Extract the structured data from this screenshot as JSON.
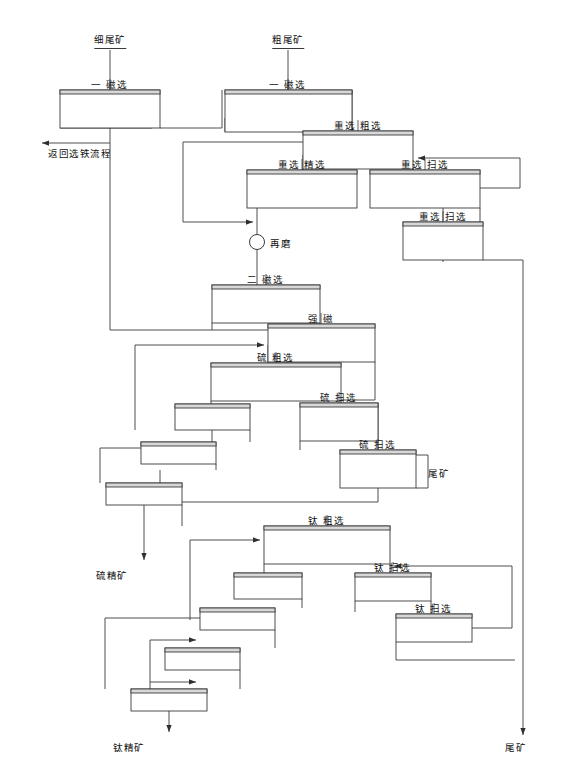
{
  "diagram": {
    "title_visible": false,
    "type": "mineral-processing-flowsheet",
    "stroke_color": "#3a3a3a",
    "fill_color": "#ffffff",
    "header_fill": "#d8d8d8",
    "feeds": [
      {
        "id": "feed-fine",
        "label": "细尾矿",
        "x": 110,
        "y": 40
      },
      {
        "id": "feed-coarse",
        "label": "粗尾矿",
        "x": 288,
        "y": 40
      }
    ],
    "products": [
      {
        "id": "return-iron",
        "label": "返回选铁流程",
        "x": 48,
        "y": 146
      },
      {
        "id": "tailings-sulfur",
        "label": "尾矿",
        "x": 428,
        "y": 466
      },
      {
        "id": "sulfur-concentrate",
        "label": "硫精矿",
        "x": 96,
        "y": 568
      },
      {
        "id": "titanium-concentrate",
        "label": "钛精矿",
        "x": 113,
        "y": 740
      },
      {
        "id": "tailings-final",
        "label": "尾矿",
        "x": 505,
        "y": 740
      }
    ],
    "mill": {
      "id": "regrind",
      "label": "再磨",
      "cx": 257,
      "cy": 242,
      "r": 7.5
    },
    "units": [
      {
        "id": "u-mag1-fine",
        "label": "一 磁选",
        "x": 60,
        "y": 90,
        "w": 100,
        "h": 38,
        "labelx": 110
      },
      {
        "id": "u-mag1-coarse",
        "label": "一 磁选",
        "x": 225,
        "y": 90,
        "w": 127,
        "h": 42,
        "labelx": 288
      },
      {
        "id": "u-grav-rough",
        "label": "重选 粗选",
        "x": 303,
        "y": 131,
        "w": 110,
        "h": 38,
        "labelx": 358
      },
      {
        "id": "u-grav-clean",
        "label": "重选 精选",
        "x": 247,
        "y": 170,
        "w": 110,
        "h": 38,
        "labelx": 302
      },
      {
        "id": "u-grav-scav1",
        "label": "重选 扫选",
        "x": 370,
        "y": 170,
        "w": 110,
        "h": 38,
        "labelx": 425
      },
      {
        "id": "u-grav-scav2",
        "label": "重选 扫选",
        "x": 403,
        "y": 222,
        "w": 80,
        "h": 38,
        "labelx": 443
      },
      {
        "id": "u-mag2",
        "label": "二 磁选",
        "x": 212,
        "y": 285,
        "w": 108,
        "h": 38,
        "labelx": 266
      },
      {
        "id": "u-high-mag",
        "label": "强 磁",
        "x": 268,
        "y": 324,
        "w": 107,
        "h": 38,
        "labelx": 321
      },
      {
        "id": "u-s-rough",
        "label": "硫 粗选",
        "x": 211,
        "y": 363,
        "w": 130,
        "h": 38,
        "labelx": 276
      },
      {
        "id": "u-s-scav1",
        "label": "硫 扫选",
        "x": 300,
        "y": 403,
        "w": 78,
        "h": 38,
        "labelx": 339
      },
      {
        "id": "u-s-scav2",
        "label": "硫 扫选",
        "x": 340,
        "y": 450,
        "w": 76,
        "h": 38,
        "labelx": 378
      },
      {
        "id": "u-s-clean1",
        "label": "",
        "x": 175,
        "y": 404,
        "w": 75,
        "h": 26,
        "labelx": 212
      },
      {
        "id": "u-s-clean2",
        "label": "",
        "x": 141,
        "y": 442,
        "w": 75,
        "h": 22,
        "labelx": 178
      },
      {
        "id": "u-s-clean3",
        "label": "",
        "x": 106,
        "y": 483,
        "w": 76,
        "h": 22,
        "labelx": 144
      },
      {
        "id": "u-ti-rough",
        "label": "钛 粗选",
        "x": 264,
        "y": 526,
        "w": 126,
        "h": 38,
        "labelx": 327
      },
      {
        "id": "u-ti-scav1",
        "label": "钛 扫选",
        "x": 355,
        "y": 573,
        "w": 76,
        "h": 28,
        "labelx": 393
      },
      {
        "id": "u-ti-scav2",
        "label": "钛 扫选",
        "x": 396,
        "y": 614,
        "w": 76,
        "h": 28,
        "labelx": 434
      },
      {
        "id": "u-ti-clean1",
        "label": "",
        "x": 234,
        "y": 573,
        "w": 68,
        "h": 26,
        "labelx": 268
      },
      {
        "id": "u-ti-clean2",
        "label": "",
        "x": 200,
        "y": 608,
        "w": 75,
        "h": 22,
        "labelx": 237
      },
      {
        "id": "u-ti-clean3",
        "label": "",
        "x": 165,
        "y": 648,
        "w": 75,
        "h": 22,
        "labelx": 202
      },
      {
        "id": "u-ti-clean4",
        "label": "",
        "x": 131,
        "y": 689,
        "w": 76,
        "h": 22,
        "labelx": 169
      }
    ]
  }
}
